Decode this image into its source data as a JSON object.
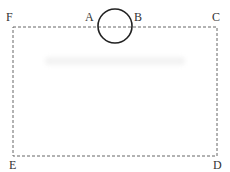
{
  "diagram": {
    "type": "geometry-figure",
    "rectangle": {
      "style": "dashed",
      "stroke": "#666666",
      "corners": {
        "top_left": "F",
        "top_right": "C",
        "bottom_right": "D",
        "bottom_left": "E"
      }
    },
    "circle": {
      "stroke": "#222222",
      "position": "centered on top edge between A and B"
    },
    "points": {
      "A": "A",
      "B": "B",
      "C": "C",
      "D": "D",
      "E": "E",
      "F": "F"
    },
    "watermark": ""
  }
}
